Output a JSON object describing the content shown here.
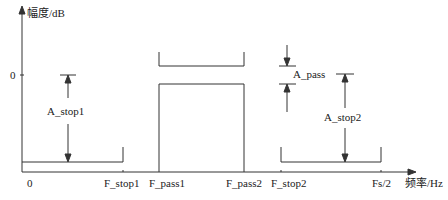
{
  "axes": {
    "y_label": "幅度/dB",
    "x_label": "频率/Hz",
    "y_zero": "0",
    "x_origin": "0"
  },
  "x_ticks": [
    "F_stop1",
    "F_pass1",
    "F_pass2",
    "F_stop2",
    "Fs/2"
  ],
  "annotations": {
    "a_stop1": "A_stop1",
    "a_pass": "A_pass",
    "a_stop2": "A_stop2"
  },
  "colors": {
    "line": "#333333",
    "background": "#ffffff"
  }
}
